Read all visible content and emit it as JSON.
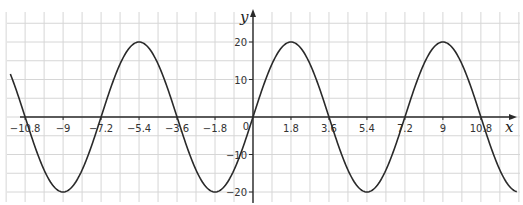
{
  "chart_data": {
    "type": "line",
    "title": "",
    "function": "y = 20 sin(πx / 3.6)",
    "xlabel": "x",
    "ylabel": "y",
    "xlim": [
      -11.5,
      12.5
    ],
    "ylim": [
      -23,
      28
    ],
    "grid": true,
    "grid_step_x": 0.9,
    "grid_step_y": 5,
    "x_ticks": [
      -10.8,
      -9,
      -7.2,
      -5.4,
      -3.6,
      -1.8,
      1.8,
      3.6,
      5.4,
      7.2,
      9,
      10.8
    ],
    "x_tick_labels": [
      "-10.8",
      "-9",
      "-7.2",
      "-5.4",
      "-3.6",
      "-1.8",
      "1.8",
      "3.6",
      "5.4",
      "7.2",
      "9",
      "10.8"
    ],
    "y_ticks": [
      20,
      10,
      -10,
      -20
    ],
    "y_tick_labels": [
      "20",
      "10",
      "-10",
      "-20"
    ],
    "origin_label": "0",
    "series": [
      {
        "name": "20 sin(πx/3.6)",
        "amplitude": 20,
        "period": 7.2,
        "x": [
          -11.5,
          -10.8,
          -9,
          -7.2,
          -5.4,
          -3.6,
          -1.8,
          0,
          1.8,
          3.6,
          5.4,
          7.2,
          9,
          10.8,
          12.5
        ],
        "values": [
          12.7,
          0,
          -20,
          0,
          20,
          0,
          -20,
          0,
          20,
          0,
          -20,
          0,
          20,
          0,
          -19.3
        ]
      }
    ],
    "key_points": {
      "maxima": [
        [
          -5.4,
          20
        ],
        [
          1.8,
          20
        ],
        [
          9,
          20
        ]
      ],
      "minima": [
        [
          -9,
          -20
        ],
        [
          -1.8,
          -20
        ],
        [
          5.4,
          -20
        ]
      ],
      "zeros": [
        -10.8,
        -7.2,
        -3.6,
        0,
        3.6,
        7.2,
        10.8
      ]
    }
  },
  "style": {
    "curve_color": "#2a2a2a",
    "axis_color": "#2a2a2a",
    "grid_color": "#d6d6d6"
  }
}
